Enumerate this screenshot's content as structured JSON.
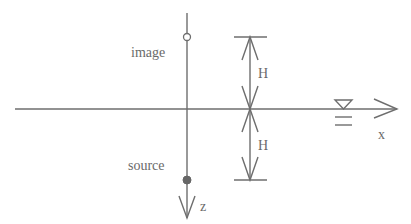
{
  "diagram": {
    "labels": {
      "image": "image",
      "source": "source",
      "z_axis": "z",
      "x_axis": "x",
      "height_upper": "H",
      "height_lower": "H"
    },
    "colors": {
      "line": "#6e6e6e",
      "text": "#6a6a6a",
      "background": "#ffffff"
    },
    "elements": {
      "image_point": "hollow-circle",
      "source_point": "filled-circle",
      "water_surface_symbol": "inverted-triangle-with-lines"
    }
  }
}
